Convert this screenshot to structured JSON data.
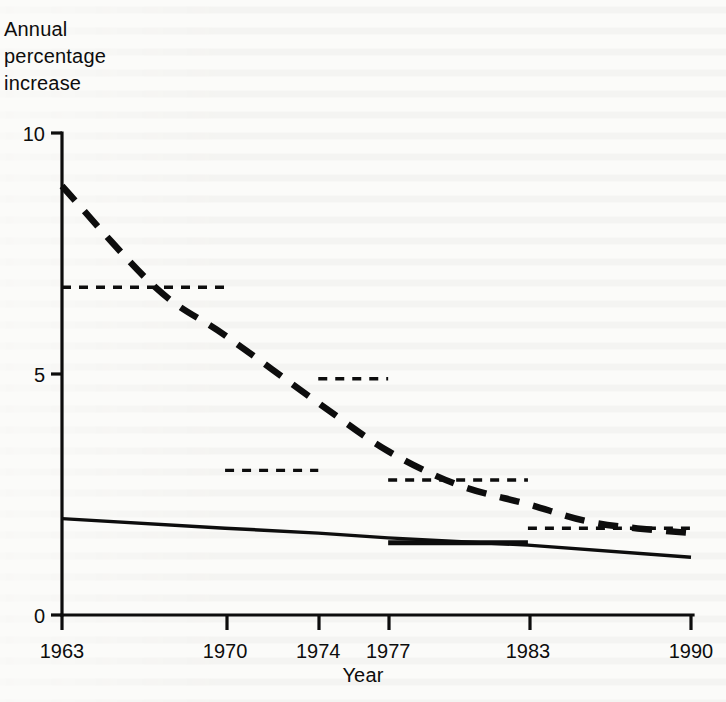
{
  "chart_data": {
    "type": "line",
    "title": "",
    "xlabel": "Year",
    "ylabel": "Annual percentage increase",
    "xlim": [
      1963,
      1990
    ],
    "ylim": [
      0,
      10
    ],
    "yticks": [
      0,
      5,
      10
    ],
    "ytick_labels": [
      "0",
      "5",
      "10"
    ],
    "xticks": [
      1963,
      1970,
      1974,
      1977,
      1983,
      1990
    ],
    "xtick_labels": [
      "1963",
      "1970",
      "1974",
      "1977",
      "1983",
      "1990"
    ],
    "grid": false,
    "legend": "none",
    "series": [
      {
        "name": "Projected annual percentage increase (dashed curve)",
        "style": "dashed-curve",
        "x": [
          1963,
          1967,
          1970,
          1974,
          1977,
          1980,
          1983,
          1986,
          1990
        ],
        "y": [
          8.9,
          6.8,
          5.8,
          4.4,
          3.4,
          2.7,
          2.3,
          1.9,
          1.7
        ]
      },
      {
        "name": "Actual annual percentage increase (solid line)",
        "style": "solid-line",
        "x": [
          1963,
          1970,
          1974,
          1977,
          1983,
          1990
        ],
        "y": [
          2.0,
          1.8,
          1.7,
          1.6,
          1.45,
          1.2
        ]
      },
      {
        "name": "Period averages (short dashed horizontal bars)",
        "style": "dashed-steps",
        "segments": [
          {
            "x0": 1963,
            "x1": 1970,
            "y": 6.8
          },
          {
            "x0": 1970,
            "x1": 1974,
            "y": 3.0
          },
          {
            "x0": 1974,
            "x1": 1977,
            "y": 4.9
          },
          {
            "x0": 1977,
            "x1": 1983,
            "y": 2.8
          },
          {
            "x0": 1983,
            "x1": 1990,
            "y": 1.8
          }
        ]
      },
      {
        "name": "Period average (solid horizontal bar)",
        "style": "solid-steps",
        "segments": [
          {
            "x0": 1977,
            "x1": 1983,
            "y": 1.5
          }
        ]
      }
    ]
  },
  "labels": {
    "y_axis_title": "Annual\npercentage\nincrease",
    "x_axis_title": "Year"
  },
  "colors": {
    "ink": "#0d0d0d",
    "paper": "#fbfbf9"
  }
}
